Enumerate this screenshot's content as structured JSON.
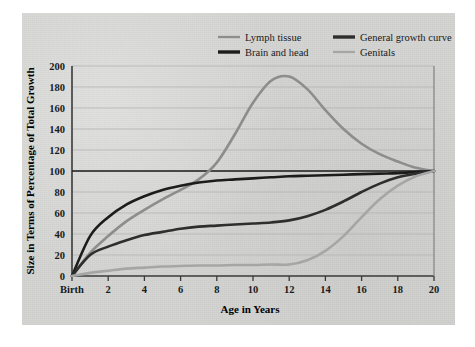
{
  "figure": {
    "panel_bg": "#d4d4d2",
    "page_bg": "#ffffff"
  },
  "chart_data": {
    "type": "line",
    "title": "",
    "xlabel": "Age in Years",
    "ylabel": "Size in Terms of Percentage of Total Growth",
    "xlim": [
      0,
      20
    ],
    "ylim": [
      0,
      200
    ],
    "grid": true,
    "legend_position": "top",
    "x_tick_labels": [
      "Birth",
      "2",
      "4",
      "6",
      "8",
      "10",
      "12",
      "14",
      "16",
      "18",
      "20"
    ],
    "x_ticks": [
      0,
      2,
      4,
      6,
      8,
      10,
      12,
      14,
      16,
      18,
      20
    ],
    "y_ticks": [
      0,
      20,
      40,
      60,
      80,
      100,
      120,
      140,
      160,
      180,
      200
    ],
    "y_tick_labels": [
      "0",
      "20",
      "40",
      "60",
      "80",
      "100",
      "120",
      "140",
      "160",
      "180",
      "200"
    ],
    "reference_line": {
      "y": 100,
      "color": "#1c1c1c"
    },
    "x": [
      0,
      1,
      2,
      3,
      4,
      5,
      6,
      7,
      8,
      9,
      10,
      11,
      12,
      13,
      14,
      15,
      16,
      17,
      18,
      19,
      20
    ],
    "series": [
      {
        "name": "Lymph tissue",
        "color": "#8d8d8d",
        "width": 2.6,
        "values": [
          0,
          22,
          38,
          52,
          63,
          73,
          82,
          92,
          108,
          135,
          165,
          186,
          190,
          178,
          158,
          140,
          126,
          116,
          109,
          103,
          100
        ]
      },
      {
        "name": "Brain and head",
        "color": "#1c1c1c",
        "width": 2.6,
        "values": [
          0,
          38,
          56,
          68,
          76,
          82,
          86,
          89,
          91,
          92,
          93,
          94,
          95,
          95.5,
          96,
          96.5,
          97,
          97.5,
          98,
          99,
          100
        ]
      },
      {
        "name": "General growth curve",
        "color": "#2e2e2e",
        "width": 2.6,
        "values": [
          0,
          20,
          28,
          34,
          39,
          42,
          45,
          47,
          48,
          49,
          50,
          51,
          53,
          57,
          63,
          71,
          80,
          88,
          94,
          97.5,
          100
        ]
      },
      {
        "name": "Genitals",
        "color": "#a6a6a6",
        "width": 2.6,
        "values": [
          0,
          3,
          5,
          7,
          8,
          9,
          9.5,
          10,
          10,
          10.5,
          10.5,
          11,
          11,
          15,
          24,
          38,
          56,
          73,
          86,
          95,
          100
        ]
      }
    ]
  },
  "legend": {
    "entries": [
      {
        "label": "Lymph tissue",
        "color": "#8d8d8d",
        "thick": false
      },
      {
        "label": "General growth curve",
        "color": "#2e2e2e",
        "thick": true
      },
      {
        "label": "Brain and head",
        "color": "#1c1c1c",
        "thick": true
      },
      {
        "label": "Genitals",
        "color": "#a6a6a6",
        "thick": false
      }
    ]
  }
}
